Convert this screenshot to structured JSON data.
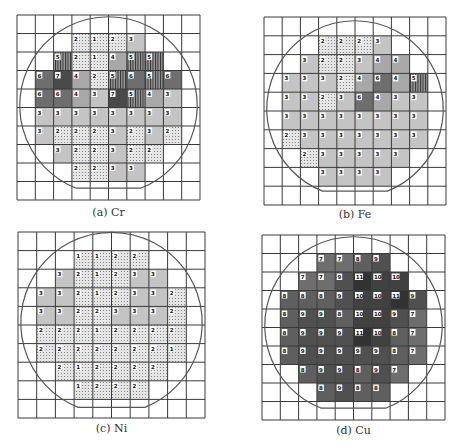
{
  "figure": {
    "panels": [
      {
        "id": "a",
        "caption": "(a) Cr",
        "element": "Cr",
        "grid": [
          [
            null,
            null,
            null,
            null,
            null,
            null,
            null,
            null,
            null,
            null
          ],
          [
            null,
            null,
            null,
            2,
            1,
            2,
            3,
            null,
            null,
            null
          ],
          [
            null,
            null,
            5,
            2,
            1,
            4,
            5,
            5,
            null,
            null
          ],
          [
            null,
            6,
            7,
            4,
            2,
            5,
            6,
            5,
            6,
            null
          ],
          [
            null,
            6,
            6,
            4,
            3,
            7,
            5,
            4,
            3,
            null
          ],
          [
            null,
            3,
            3,
            3,
            3,
            3,
            3,
            3,
            3,
            null
          ],
          [
            null,
            3,
            2,
            2,
            2,
            3,
            2,
            3,
            2,
            null
          ],
          [
            null,
            null,
            3,
            2,
            2,
            3,
            2,
            2,
            null,
            null
          ],
          [
            null,
            null,
            null,
            2,
            2,
            3,
            3,
            null,
            null,
            null
          ],
          [
            null,
            null,
            null,
            null,
            null,
            null,
            null,
            null,
            null,
            null
          ]
        ]
      },
      {
        "id": "b",
        "caption": "(b) Fe",
        "element": "Fe",
        "grid": [
          [
            null,
            null,
            null,
            null,
            null,
            null,
            null,
            null,
            null,
            null
          ],
          [
            null,
            null,
            null,
            2,
            2,
            2,
            3,
            null,
            null,
            null
          ],
          [
            null,
            null,
            3,
            2,
            2,
            3,
            4,
            4,
            null,
            null
          ],
          [
            null,
            3,
            3,
            3,
            2,
            4,
            6,
            4,
            5,
            null
          ],
          [
            null,
            3,
            3,
            2,
            3,
            6,
            4,
            3,
            3,
            null
          ],
          [
            null,
            3,
            3,
            3,
            3,
            3,
            3,
            3,
            3,
            null
          ],
          [
            null,
            2,
            3,
            3,
            3,
            3,
            3,
            3,
            3,
            null
          ],
          [
            null,
            null,
            2,
            3,
            3,
            3,
            3,
            3,
            null,
            null
          ],
          [
            null,
            null,
            null,
            3,
            3,
            3,
            3,
            null,
            null,
            null
          ],
          [
            null,
            null,
            null,
            null,
            null,
            null,
            null,
            null,
            null,
            null
          ]
        ]
      },
      {
        "id": "c",
        "caption": "(c) Ni",
        "element": "Ni",
        "grid": [
          [
            null,
            null,
            null,
            null,
            null,
            null,
            null,
            null,
            null,
            null
          ],
          [
            null,
            null,
            null,
            1,
            1,
            2,
            2,
            null,
            null,
            null
          ],
          [
            null,
            null,
            3,
            2,
            1,
            2,
            3,
            3,
            null,
            null
          ],
          [
            null,
            3,
            3,
            2,
            1,
            2,
            3,
            3,
            2,
            null
          ],
          [
            null,
            3,
            3,
            2,
            2,
            3,
            3,
            3,
            2,
            null
          ],
          [
            null,
            2,
            2,
            2,
            1,
            2,
            2,
            2,
            2,
            null
          ],
          [
            null,
            2,
            2,
            2,
            2,
            2,
            2,
            2,
            1,
            null
          ],
          [
            null,
            null,
            2,
            1,
            2,
            2,
            2,
            2,
            null,
            null
          ],
          [
            null,
            null,
            null,
            1,
            2,
            2,
            2,
            null,
            null,
            null
          ],
          [
            null,
            null,
            null,
            null,
            null,
            null,
            null,
            null,
            null,
            null
          ]
        ]
      },
      {
        "id": "d",
        "caption": "(d) Cu",
        "element": "Cu",
        "grid": [
          [
            null,
            null,
            null,
            null,
            null,
            null,
            null,
            null,
            null,
            null
          ],
          [
            null,
            null,
            null,
            7,
            7,
            8,
            9,
            null,
            null,
            null
          ],
          [
            null,
            null,
            7,
            7,
            9,
            11,
            10,
            10,
            null,
            null
          ],
          [
            null,
            8,
            8,
            8,
            9,
            10,
            10,
            11,
            9,
            null
          ],
          [
            null,
            8,
            9,
            9,
            8,
            10,
            10,
            9,
            7,
            null
          ],
          [
            null,
            8,
            9,
            9,
            9,
            11,
            10,
            8,
            7,
            null
          ],
          [
            null,
            8,
            9,
            9,
            9,
            9,
            9,
            8,
            7,
            null
          ],
          [
            null,
            null,
            8,
            9,
            9,
            8,
            9,
            7,
            null,
            null
          ],
          [
            null,
            null,
            null,
            8,
            9,
            8,
            8,
            null,
            null,
            null
          ],
          [
            null,
            null,
            null,
            null,
            null,
            null,
            null,
            null,
            null,
            null
          ]
        ]
      }
    ]
  }
}
